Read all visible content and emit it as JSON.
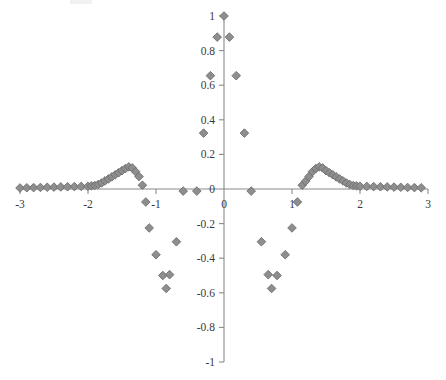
{
  "figure": {
    "title": "",
    "background_color": "#ffffff",
    "axis_color": "#8a8a8a",
    "marker_fill": "#8e8e8e",
    "marker_stroke": "#6e6e6e",
    "tick_label_color": "#3a3a3a"
  },
  "chart_data": {
    "type": "scatter",
    "title": "",
    "xlabel": "",
    "ylabel": "",
    "xlim": [
      -3,
      3
    ],
    "ylim": [
      -1,
      1
    ],
    "grid": false,
    "legend": null,
    "marker": "diamond",
    "marker_color": "#8e8e8e",
    "xticks": [
      -3,
      -2,
      -1,
      0,
      1,
      2,
      3
    ],
    "xtick_labels": [
      "-3",
      "-2",
      "-1",
      "0",
      "1",
      "2",
      "3"
    ],
    "yticks": [
      -1,
      -0.8,
      -0.6,
      -0.4,
      -0.2,
      0,
      0.2,
      0.4,
      0.6,
      0.8,
      1
    ],
    "ytick_labels": [
      "-1",
      "-0.8",
      "-0.6",
      "-0.4",
      "-0.2",
      "0",
      "0.2",
      "0.4",
      "0.6",
      "0.8",
      "1"
    ],
    "points": [
      [
        -3.0,
        0.006
      ],
      [
        -2.9,
        0.007
      ],
      [
        -2.8,
        0.008
      ],
      [
        -2.7,
        0.009
      ],
      [
        -2.6,
        0.01
      ],
      [
        -2.5,
        0.011
      ],
      [
        -2.4,
        0.012
      ],
      [
        -2.3,
        0.013
      ],
      [
        -2.2,
        0.014
      ],
      [
        -2.1,
        0.015
      ],
      [
        -2.0,
        0.016
      ],
      [
        -1.95,
        0.018
      ],
      [
        -1.9,
        0.02
      ],
      [
        -1.85,
        0.026
      ],
      [
        -1.8,
        0.035
      ],
      [
        -1.75,
        0.047
      ],
      [
        -1.7,
        0.058
      ],
      [
        -1.65,
        0.07
      ],
      [
        -1.6,
        0.082
      ],
      [
        -1.55,
        0.094
      ],
      [
        -1.5,
        0.106
      ],
      [
        -1.45,
        0.118
      ],
      [
        -1.4,
        0.128
      ],
      [
        -1.35,
        0.122
      ],
      [
        -1.3,
        0.1
      ],
      [
        -1.25,
        0.072
      ],
      [
        -1.2,
        0.022
      ],
      [
        -1.15,
        -0.075
      ],
      [
        -1.1,
        -0.225
      ],
      [
        -1.0,
        -0.38
      ],
      [
        -0.9,
        -0.5
      ],
      [
        -0.85,
        -0.575
      ],
      [
        -0.8,
        -0.495
      ],
      [
        -0.7,
        -0.305
      ],
      [
        -0.6,
        -0.012
      ],
      [
        -0.4,
        -0.012
      ],
      [
        -0.3,
        0.323
      ],
      [
        -0.2,
        0.655
      ],
      [
        -0.1,
        0.878
      ],
      [
        0.0,
        1.0
      ],
      [
        0.08,
        0.878
      ],
      [
        0.18,
        0.655
      ],
      [
        0.3,
        0.323
      ],
      [
        0.4,
        -0.012
      ],
      [
        0.55,
        -0.305
      ],
      [
        0.65,
        -0.495
      ],
      [
        0.7,
        -0.575
      ],
      [
        0.78,
        -0.5
      ],
      [
        0.9,
        -0.38
      ],
      [
        1.0,
        -0.225
      ],
      [
        1.08,
        -0.075
      ],
      [
        1.15,
        0.022
      ],
      [
        1.2,
        0.045
      ],
      [
        1.25,
        0.072
      ],
      [
        1.3,
        0.1
      ],
      [
        1.35,
        0.118
      ],
      [
        1.4,
        0.128
      ],
      [
        1.45,
        0.122
      ],
      [
        1.5,
        0.106
      ],
      [
        1.55,
        0.094
      ],
      [
        1.6,
        0.082
      ],
      [
        1.65,
        0.07
      ],
      [
        1.7,
        0.058
      ],
      [
        1.75,
        0.047
      ],
      [
        1.8,
        0.035
      ],
      [
        1.85,
        0.026
      ],
      [
        1.9,
        0.02
      ],
      [
        1.95,
        0.018
      ],
      [
        2.0,
        0.016
      ],
      [
        2.1,
        0.015
      ],
      [
        2.2,
        0.014
      ],
      [
        2.3,
        0.013
      ],
      [
        2.4,
        0.012
      ],
      [
        2.5,
        0.011
      ],
      [
        2.6,
        0.01
      ],
      [
        2.7,
        0.009
      ],
      [
        2.8,
        0.008
      ],
      [
        2.9,
        0.007
      ]
    ]
  }
}
